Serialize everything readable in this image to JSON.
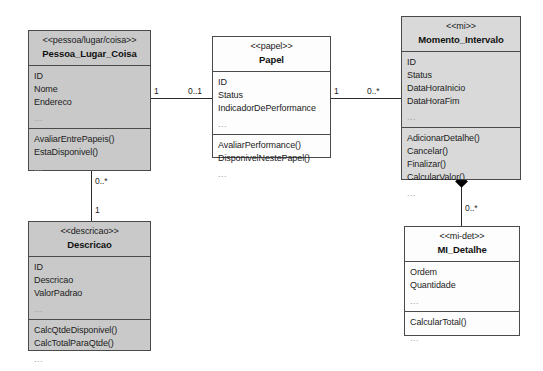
{
  "diagram": {
    "background_color": "#ffffff",
    "border_color": "#4a4a4a",
    "ellipsis": "..."
  },
  "classes": [
    {
      "id": "pessoa-lugar-coisa",
      "stereotype": "<<pessoa/lugar/coisa>>",
      "name": "Pessoa_Lugar_Coisa",
      "fill": "#c9c9c9",
      "attributes": [
        "ID",
        "Nome",
        "Endereco"
      ],
      "operations": [
        "AvaliarEntrePapeis()",
        "EstaDisponivel()"
      ]
    },
    {
      "id": "papel",
      "stereotype": "<<papel>>",
      "name": "Papel",
      "fill": "#fdfdfd",
      "attributes": [
        "ID",
        "Status",
        "IndicadorDePerformance"
      ],
      "operations": [
        "AvaliarPerformance()",
        "DisponivelNestePapel()"
      ]
    },
    {
      "id": "momento-intervalo",
      "stereotype": "<<mi>>",
      "name": "Momento_Intervalo",
      "fill": "#d9d9d9",
      "attributes": [
        "ID",
        "Status",
        "DataHoraInicio",
        "DataHoraFim"
      ],
      "operations": [
        "AdicionarDetalhe()",
        "Cancelar()",
        "Finalizar()",
        "CalcularValor()"
      ]
    },
    {
      "id": "descricao",
      "stereotype": "<<descricao>>",
      "name": "Descricao",
      "fill": "#c9c9c9",
      "attributes": [
        "ID",
        "Descricao",
        "ValorPadrao"
      ],
      "operations": [
        "CalcQtdeDisponivel()",
        "CalcTotalParaQtde()"
      ]
    },
    {
      "id": "mi-detalhe",
      "stereotype": "<<mi-det>>",
      "name": "MI_Detalhe",
      "fill": "#fdfdfd",
      "attributes": [
        "Ordem",
        "Quantidade"
      ],
      "operations": [
        "CalcularTotal()"
      ]
    }
  ],
  "associations": [
    {
      "id": "plc-papel",
      "source": "pessoa-lugar-coisa",
      "target": "papel",
      "source_multiplicity": "1",
      "target_multiplicity": "0..1",
      "kind": "association"
    },
    {
      "id": "papel-mi",
      "source": "papel",
      "target": "momento-intervalo",
      "source_multiplicity": "1",
      "target_multiplicity": "0..*",
      "kind": "association"
    },
    {
      "id": "plc-descricao",
      "source": "pessoa-lugar-coisa",
      "target": "descricao",
      "source_multiplicity": "0..*",
      "target_multiplicity": "1",
      "kind": "association"
    },
    {
      "id": "mi-midetalhe",
      "source": "momento-intervalo",
      "target": "mi-detalhe",
      "source_multiplicity": "",
      "target_multiplicity": "0..*",
      "kind": "composition"
    }
  ]
}
